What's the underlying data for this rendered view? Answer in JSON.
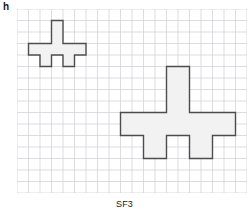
{
  "figure": {
    "part_label": "h",
    "caption": "SF3",
    "scale_factor": 3
  },
  "grid": {
    "columns": 20,
    "rows": 16,
    "cell_px": 11.5,
    "origin_x_px": 17,
    "origin_y_px": 9,
    "line_color": "#cfcfd4",
    "show": true
  },
  "style": {
    "shape_fill": "#f2f2f2",
    "shape_stroke": "#4d4d4d",
    "shape_stroke_width": 1.4,
    "background": "#ffffff",
    "text_color": "#1a1a1a"
  },
  "shapes": [
    {
      "name": "small-cross",
      "role": "original",
      "scale": 1,
      "origin_cell": [
        1,
        1
      ],
      "width_cells": 5,
      "height_cells": 4,
      "cell_outline": [
        [
          2,
          0
        ],
        [
          3,
          0
        ],
        [
          3,
          2
        ],
        [
          5,
          2
        ],
        [
          5,
          3
        ],
        [
          4,
          3
        ],
        [
          4,
          4
        ],
        [
          3,
          4
        ],
        [
          3,
          3
        ],
        [
          2,
          3
        ],
        [
          2,
          4
        ],
        [
          1,
          4
        ],
        [
          1,
          3
        ],
        [
          0,
          3
        ],
        [
          0,
          2
        ],
        [
          2,
          2
        ]
      ]
    },
    {
      "name": "large-cross",
      "role": "enlargement",
      "scale": 3,
      "origin_cell": [
        9,
        5
      ],
      "width_cells": 10,
      "height_cells": 8,
      "cell_outline": [
        [
          4,
          0
        ],
        [
          6,
          0
        ],
        [
          6,
          4
        ],
        [
          10,
          4
        ],
        [
          10,
          6
        ],
        [
          8,
          6
        ],
        [
          8,
          8
        ],
        [
          6,
          8
        ],
        [
          6,
          6
        ],
        [
          4,
          6
        ],
        [
          4,
          8
        ],
        [
          2,
          8
        ],
        [
          2,
          6
        ],
        [
          0,
          6
        ],
        [
          0,
          4
        ],
        [
          4,
          4
        ]
      ]
    }
  ]
}
